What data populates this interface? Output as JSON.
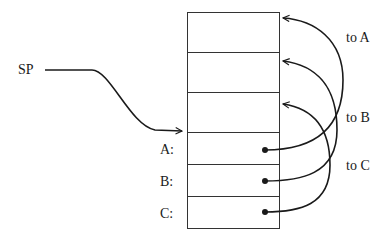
{
  "diagram": {
    "type": "stack-frame",
    "pointer_label": "SP",
    "stack_cells": [
      {
        "label": ""
      },
      {
        "label": ""
      },
      {
        "label": ""
      },
      {
        "label": "A:"
      },
      {
        "label": "B:"
      },
      {
        "label": "C:"
      }
    ],
    "link_labels": {
      "to_a": "to A",
      "to_b": "to B",
      "to_c": "to C"
    },
    "colors": {
      "stroke": "#1a1a1a",
      "background": "#ffffff"
    }
  }
}
